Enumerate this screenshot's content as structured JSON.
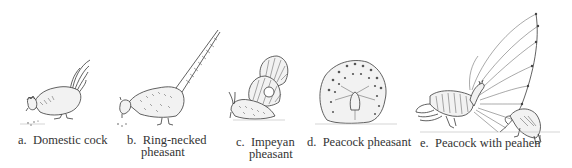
{
  "figure": {
    "panels": [
      {
        "id": "a",
        "letter": "a.",
        "label": "Domestic cock",
        "label_line2": ""
      },
      {
        "id": "b",
        "letter": "b.",
        "label": "Ring-necked",
        "label_line2": "pheasant"
      },
      {
        "id": "c",
        "letter": "c.",
        "label": "Impeyan",
        "label_line2": "pheasant"
      },
      {
        "id": "d",
        "letter": "d.",
        "label": "Peacock pheasant",
        "label_line2": ""
      },
      {
        "id": "e",
        "letter": "e.",
        "label": "Peacock with peahen",
        "label_line2": ""
      }
    ],
    "ink_color": "#3a3a3a",
    "background": "#ffffff"
  }
}
